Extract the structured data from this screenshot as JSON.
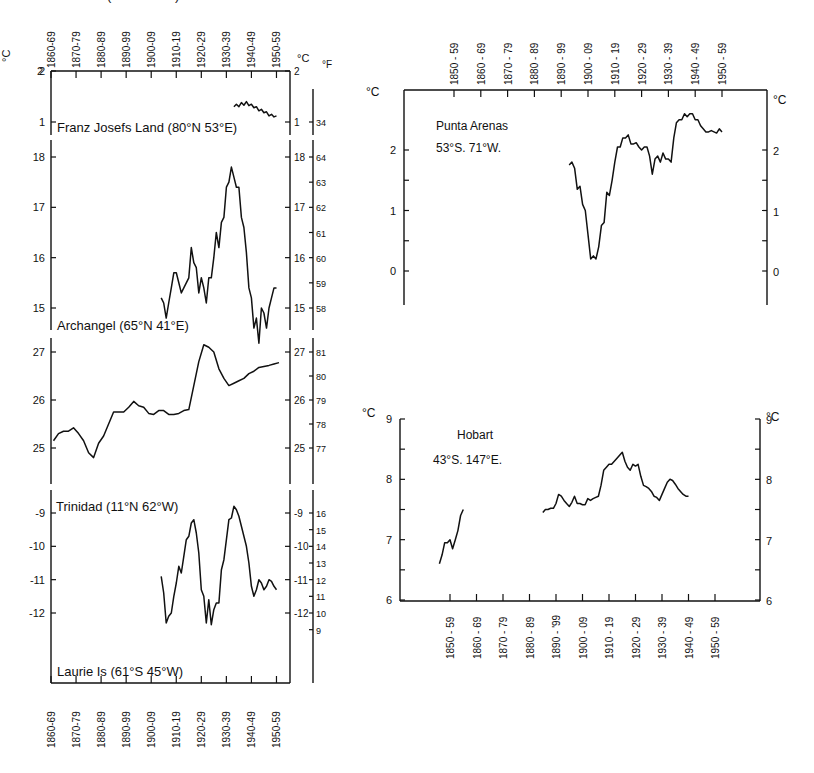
{
  "chart_data": [
    {
      "id": "franz_josefs_land",
      "type": "line",
      "title": "Franz Josefs Land (80°N 53°E)",
      "xlabel": "",
      "ylabel": "°C",
      "ylabel_right": "°C",
      "ylabel_right2": "°F",
      "x_tick_labels_top": [
        "1860-69",
        "1870-79",
        "1880-89",
        "1890-99",
        "1900-09",
        "1910-19",
        "1920-29",
        "1930-39",
        "1940-49",
        "1950-59"
      ],
      "yticks_left": [
        1,
        2
      ],
      "yticks_right": [
        1,
        2
      ],
      "yticks_f": [
        34,
        35
      ],
      "ylim": [
        0.6,
        2
      ],
      "series": [
        {
          "name": "10-yr running mean",
          "x": [
            1933,
            1934,
            1935,
            1936,
            1937,
            1938,
            1939,
            1940,
            1941,
            1942,
            1943,
            1944,
            1945,
            1946,
            1947,
            1948,
            1949,
            1950
          ],
          "y": [
            1.3,
            1.35,
            1.3,
            1.38,
            1.33,
            1.4,
            1.32,
            1.35,
            1.28,
            1.3,
            1.22,
            1.25,
            1.18,
            1.2,
            1.12,
            1.15,
            1.1,
            1.12
          ]
        }
      ]
    },
    {
      "id": "archangel",
      "type": "line",
      "title": "Archangel (65°N 41°E)",
      "ylabel": "°C",
      "ylabel_right2": "°F",
      "yticks_left": [
        15,
        16,
        17,
        18
      ],
      "yticks_right": [
        15,
        16,
        17,
        18
      ],
      "yticks_f": [
        58,
        59,
        60,
        61,
        62,
        63,
        64
      ],
      "ylim": [
        14.3,
        18.2
      ],
      "series": [
        {
          "name": "10-yr running mean",
          "x": [
            1904,
            1905,
            1906,
            1907,
            1908,
            1909,
            1910,
            1911,
            1912,
            1913,
            1914,
            1915,
            1916,
            1917,
            1918,
            1919,
            1920,
            1921,
            1922,
            1923,
            1924,
            1925,
            1926,
            1927,
            1928,
            1929,
            1930,
            1931,
            1932,
            1933,
            1934,
            1935,
            1936,
            1937,
            1938,
            1939,
            1940,
            1941,
            1942,
            1943,
            1944,
            1945,
            1946,
            1947,
            1948,
            1949,
            1950
          ],
          "y": [
            15.2,
            15.1,
            14.8,
            15.1,
            15.4,
            15.7,
            15.7,
            15.5,
            15.3,
            15.4,
            15.5,
            15.6,
            16.2,
            15.9,
            15.8,
            15.3,
            15.6,
            15.4,
            15.1,
            15.6,
            15.6,
            16.0,
            16.5,
            16.2,
            16.7,
            16.8,
            17.4,
            17.5,
            17.8,
            17.6,
            17.4,
            17.4,
            16.8,
            16.6,
            16.1,
            15.4,
            15.2,
            14.6,
            14.8,
            14.3,
            15.0,
            14.9,
            14.6,
            15.0,
            15.2,
            15.4,
            15.4
          ]
        }
      ]
    },
    {
      "id": "trinidad",
      "type": "line",
      "title": "Trinidad (11°N 62°W)",
      "ylabel": "°C",
      "ylabel_right2": "°F",
      "yticks_left": [
        25,
        26,
        27
      ],
      "yticks_right": [
        25,
        26,
        27
      ],
      "yticks_f": [
        77,
        78,
        79,
        80,
        81
      ],
      "ylim": [
        24.8,
        27.4
      ],
      "series": [
        {
          "name": "10-yr running mean",
          "x": [
            1861,
            1863,
            1865,
            1867,
            1869,
            1871,
            1873,
            1875,
            1877,
            1879,
            1881,
            1883,
            1885,
            1887,
            1889,
            1891,
            1893,
            1895,
            1897,
            1899,
            1901,
            1903,
            1905,
            1907,
            1909,
            1911,
            1913,
            1915,
            1917,
            1919,
            1921,
            1923,
            1925,
            1927,
            1929,
            1931,
            1933,
            1935,
            1937,
            1939,
            1941,
            1943,
            1945,
            1947,
            1949,
            1951
          ],
          "y": [
            25.15,
            25.3,
            25.35,
            25.35,
            25.42,
            25.3,
            25.15,
            24.9,
            24.8,
            25.1,
            25.25,
            25.5,
            25.75,
            25.75,
            25.75,
            25.85,
            25.97,
            25.88,
            25.85,
            25.72,
            25.7,
            25.78,
            25.78,
            25.7,
            25.7,
            25.72,
            25.78,
            25.8,
            26.3,
            26.8,
            27.15,
            27.1,
            27.0,
            26.65,
            26.45,
            26.3,
            26.35,
            26.4,
            26.45,
            26.55,
            26.6,
            26.68,
            26.7,
            26.72,
            26.75,
            26.78
          ]
        }
      ]
    },
    {
      "id": "laurie_is",
      "type": "line",
      "title": "Laurie Is (61°S 45°W)",
      "ylabel": "°C",
      "ylabel_right2": "°F",
      "yticks_left": [
        -12,
        -11,
        -10,
        -9
      ],
      "yticks_right": [
        -12,
        -11,
        -10,
        -9
      ],
      "yticks_f": [
        9,
        10,
        11,
        12,
        13,
        14,
        15,
        16
      ],
      "ylim": [
        -12.5,
        -8.7
      ],
      "x_tick_labels_bottom": [
        "1860-69",
        "1870-79",
        "1880-89",
        "1890-99",
        "1900-09",
        "1910-19",
        "1920-29",
        "1930-39",
        "1940-49",
        "1950-59"
      ],
      "series": [
        {
          "name": "10-yr running mean",
          "x": [
            1904,
            1905,
            1906,
            1907,
            1908,
            1909,
            1910,
            1911,
            1912,
            1913,
            1914,
            1915,
            1916,
            1917,
            1918,
            1919,
            1920,
            1921,
            1922,
            1923,
            1924,
            1925,
            1926,
            1927,
            1928,
            1929,
            1930,
            1931,
            1932,
            1933,
            1934,
            1935,
            1936,
            1937,
            1938,
            1939,
            1940,
            1941,
            1942,
            1943,
            1944,
            1945,
            1946,
            1947,
            1948,
            1949,
            1950
          ],
          "y": [
            -10.9,
            -11.4,
            -12.3,
            -12.1,
            -12.0,
            -11.5,
            -11.1,
            -10.6,
            -10.8,
            -10.3,
            -9.8,
            -9.7,
            -9.3,
            -9.2,
            -9.6,
            -10.2,
            -11.3,
            -11.5,
            -12.3,
            -11.6,
            -12.35,
            -11.9,
            -11.7,
            -11.7,
            -10.7,
            -10.4,
            -9.8,
            -9.2,
            -9.15,
            -8.8,
            -8.9,
            -9.1,
            -9.4,
            -9.7,
            -10.0,
            -10.5,
            -11.2,
            -11.5,
            -11.3,
            -11.0,
            -11.1,
            -11.3,
            -11.2,
            -11.0,
            -11.05,
            -11.2,
            -11.3
          ]
        }
      ]
    },
    {
      "id": "punta_arenas",
      "type": "line",
      "title": "Punta Arenas",
      "subtitle": "53°S. 71°W.",
      "ylabel": "°C",
      "ylabel_right": "°C",
      "x_tick_labels_top": [
        "1850 - 59",
        "1860 - 69",
        "1870 - 79",
        "1880 - 89",
        "1890 - 99",
        "1900 - 09",
        "1910 - 19",
        "1920 - 29",
        "1930 - 39",
        "1940 - 49",
        "1950 - 59"
      ],
      "yticks_left": [
        0,
        1,
        2
      ],
      "yticks_right": [
        0,
        1,
        2
      ],
      "ylim": [
        -0.5,
        3.0
      ],
      "series": [
        {
          "name": "10-yr running mean",
          "x": [
            1893,
            1894,
            1895,
            1896,
            1897,
            1898,
            1899,
            1900,
            1901,
            1902,
            1903,
            1904,
            1905,
            1906,
            1907,
            1908,
            1909,
            1910,
            1911,
            1912,
            1913,
            1914,
            1915,
            1916,
            1917,
            1918,
            1919,
            1920,
            1921,
            1922,
            1923,
            1924,
            1925,
            1926,
            1927,
            1928,
            1929,
            1930,
            1931,
            1932,
            1933,
            1934,
            1935,
            1936,
            1937,
            1938,
            1939,
            1940,
            1941,
            1942,
            1943,
            1944,
            1945,
            1946,
            1947,
            1948,
            1949,
            1950
          ],
          "y": [
            1.75,
            1.8,
            1.7,
            1.35,
            1.4,
            1.1,
            1.0,
            0.6,
            0.2,
            0.25,
            0.2,
            0.4,
            0.75,
            0.8,
            1.3,
            1.25,
            1.5,
            1.8,
            2.05,
            2.05,
            2.2,
            2.2,
            2.25,
            2.1,
            2.1,
            2.12,
            2.05,
            2.0,
            2.05,
            2.05,
            1.9,
            1.6,
            1.85,
            1.9,
            1.8,
            1.95,
            1.85,
            1.85,
            1.8,
            2.2,
            2.45,
            2.5,
            2.5,
            2.6,
            2.55,
            2.6,
            2.6,
            2.5,
            2.5,
            2.4,
            2.35,
            2.3,
            2.3,
            2.32,
            2.3,
            2.28,
            2.35,
            2.3
          ]
        }
      ]
    },
    {
      "id": "hobart",
      "type": "line",
      "title": "Hobart",
      "subtitle": "43°S. 147°E.",
      "ylabel": "°C",
      "ylabel_right": "°C",
      "x_tick_labels_bottom": [
        "1850 - 59",
        "1860 - 69",
        "1870 - 79",
        "1880 - 89",
        "1890 - '99",
        "1900 - 09",
        "1910 - 19",
        "1920 - 29",
        "1930 - 39",
        "1940 - 49",
        "1950 - 59"
      ],
      "yticks_left": [
        6,
        7,
        8,
        9
      ],
      "yticks_right": [
        6,
        7,
        8,
        9
      ],
      "ylim": [
        6,
        9
      ],
      "series": [
        {
          "name": "10-yr running mean (early)",
          "x": [
            1846,
            1847,
            1848,
            1849,
            1850,
            1851,
            1852,
            1853,
            1854,
            1855
          ],
          "y": [
            6.6,
            6.75,
            6.95,
            6.95,
            7.0,
            6.85,
            7.0,
            7.15,
            7.4,
            7.5
          ]
        },
        {
          "name": "10-yr running mean",
          "x": [
            1885,
            1886,
            1887,
            1888,
            1889,
            1890,
            1891,
            1892,
            1893,
            1894,
            1895,
            1896,
            1897,
            1898,
            1899,
            1900,
            1901,
            1902,
            1903,
            1904,
            1905,
            1906,
            1907,
            1908,
            1909,
            1910,
            1911,
            1912,
            1913,
            1914,
            1915,
            1916,
            1917,
            1918,
            1919,
            1920,
            1921,
            1922,
            1923,
            1924,
            1925,
            1926,
            1927,
            1928,
            1929,
            1930,
            1931,
            1932,
            1933,
            1934,
            1935,
            1936,
            1937,
            1938,
            1939,
            1940,
            1941,
            1942,
            1943,
            1944,
            1945,
            1946,
            1947,
            1948,
            1949,
            1950
          ],
          "y": [
            7.45,
            7.5,
            7.5,
            7.52,
            7.52,
            7.6,
            7.75,
            7.72,
            7.65,
            7.6,
            7.55,
            7.62,
            7.72,
            7.6,
            7.6,
            7.58,
            7.58,
            7.68,
            7.65,
            7.68,
            7.7,
            7.72,
            7.9,
            8.15,
            8.2,
            8.25,
            8.25,
            8.3,
            8.35,
            8.4,
            8.45,
            8.3,
            8.2,
            8.15,
            8.25,
            8.22,
            8.25,
            8.05,
            7.9,
            7.88,
            7.85,
            7.8,
            7.72,
            7.7,
            7.65,
            7.75,
            7.85,
            7.95,
            8.0,
            7.98,
            7.92,
            7.85,
            7.8,
            7.75,
            7.72,
            7.72
          ]
        }
      ]
    }
  ],
  "layout_text": {
    "deg_c": "°C",
    "deg_f": "°F"
  }
}
